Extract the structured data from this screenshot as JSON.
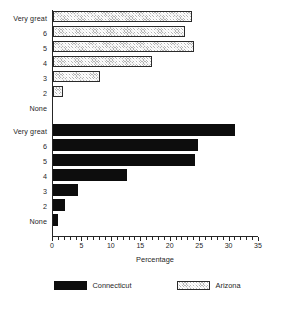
{
  "chart_data": {
    "type": "bar",
    "orientation": "horizontal",
    "title": "",
    "xlabel": "Percentage",
    "ylabel": "",
    "xlim": [
      0,
      35
    ],
    "xticks": [
      0,
      5,
      10,
      15,
      20,
      25,
      30,
      35
    ],
    "xtick_labels": [
      "0",
      "5",
      "10",
      "15",
      "20",
      "25",
      "30",
      "35"
    ],
    "minor_tick_step": 1,
    "grid": false,
    "legend_position": "bottom",
    "categories": [
      "Very great",
      "6",
      "5",
      "4",
      "3",
      "2",
      "None"
    ],
    "groups": [
      {
        "name": "Arizona",
        "color": "#b4b4b4",
        "fill": "hatched",
        "categories": [
          "Very great",
          "6",
          "5",
          "4",
          "3",
          "2",
          "None"
        ],
        "values": [
          23.6,
          22.4,
          24.0,
          16.8,
          8.0,
          1.7,
          0.0
        ]
      },
      {
        "name": "Connecticut",
        "color": "#0d0d0d",
        "fill": "solid",
        "categories": [
          "Very great",
          "6",
          "5",
          "4",
          "3",
          "2",
          "None"
        ],
        "values": [
          31.0,
          24.7,
          24.1,
          12.5,
          4.3,
          2.0,
          0.8
        ]
      }
    ],
    "series": [
      {
        "name": "Arizona",
        "values": [
          23.6,
          22.4,
          24.0,
          16.8,
          8.0,
          1.7,
          0.0
        ]
      },
      {
        "name": "Connecticut",
        "values": [
          31.0,
          24.7,
          24.1,
          12.5,
          4.3,
          2.0,
          0.8
        ]
      }
    ]
  },
  "legend": {
    "items": [
      {
        "label": "Connecticut",
        "swatch": "solid-black-swatch"
      },
      {
        "label": "Arizona",
        "swatch": "hatched-gray-swatch"
      }
    ]
  }
}
